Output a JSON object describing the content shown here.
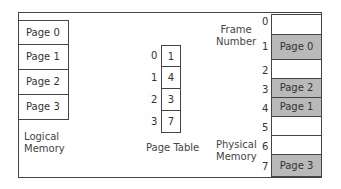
{
  "logical_memory": {
    "label_line1": "Logical",
    "label_line2": "Memory",
    "pages": [
      "Page 0",
      "Page 1",
      "Page 2",
      "Page 3"
    ]
  },
  "page_table": {
    "label": "Page Table",
    "indices": [
      "0",
      "1",
      "2",
      "3"
    ],
    "frames": [
      "1",
      "4",
      "3",
      "7"
    ]
  },
  "physical_memory": {
    "frame_label_line1": "Frame",
    "frame_label_line2": "Number",
    "label_line1": "Physical",
    "label_line2": "Memory",
    "frame_numbers": [
      "0",
      "1",
      "2",
      "3",
      "4",
      "5",
      "6",
      "7"
    ],
    "frames": [
      "",
      "Page 0",
      "",
      "Page 2",
      "Page 1",
      "",
      "",
      "Page 3"
    ],
    "filled_color": "#b9b9b9"
  }
}
